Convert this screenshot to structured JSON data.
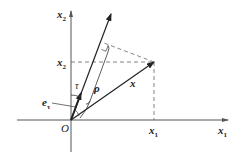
{
  "diagram": {
    "labels": {
      "y_axis": "x",
      "y_axis_sub": "2",
      "x_axis": "x",
      "x_axis_sub": "1",
      "x2_tick": "x",
      "x2_tick_sub": "2",
      "x1_tick": "x",
      "x1_tick_sub": "1",
      "origin": "O",
      "angle": "τ",
      "rho": "ρ",
      "vector": "x",
      "unit_vector": "e",
      "unit_vector_sub": "τ"
    },
    "colors": {
      "line": "#222222",
      "dashed": "#555555",
      "background": "#ffffff"
    }
  }
}
